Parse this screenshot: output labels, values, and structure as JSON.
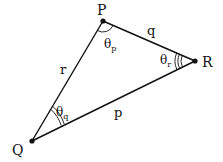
{
  "diagram": {
    "type": "triangle",
    "vertices": [
      {
        "id": "P",
        "label": "P",
        "x": 103,
        "y": 21
      },
      {
        "id": "Q",
        "label": "Q",
        "x": 32,
        "y": 141
      },
      {
        "id": "R",
        "label": "R",
        "x": 195,
        "y": 61
      }
    ],
    "sides": [
      {
        "id": "q",
        "label": "q",
        "from": "P",
        "to": "R"
      },
      {
        "id": "r",
        "label": "r",
        "from": "P",
        "to": "Q"
      },
      {
        "id": "p",
        "label": "p",
        "from": "Q",
        "to": "R"
      }
    ],
    "angles": [
      {
        "id": "theta_p",
        "symbol": "θ",
        "subscript": "p",
        "at": "P",
        "arcs": 1
      },
      {
        "id": "theta_q",
        "symbol": "θ",
        "subscript": "q",
        "at": "Q",
        "arcs": 2
      },
      {
        "id": "theta_r",
        "symbol": "θ",
        "subscript": "r",
        "at": "R",
        "arcs": 3
      }
    ],
    "colors": {
      "line": "#111111",
      "background": "#ffffff"
    }
  }
}
